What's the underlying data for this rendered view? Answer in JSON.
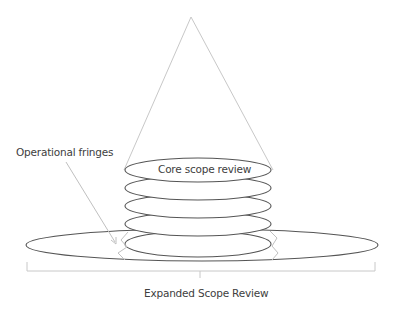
{
  "diagram": {
    "labels": {
      "core": "Core scope review",
      "fringes": "Operational fringes",
      "expanded": "Expanded Scope Review"
    },
    "colors": {
      "cone_line": "#c8c8c8",
      "ellipse_stroke": "#555555",
      "fringe_line": "#c0c0c0",
      "bracket": "#c8c8c8",
      "text": "#404040"
    },
    "stack_layers": 5
  }
}
